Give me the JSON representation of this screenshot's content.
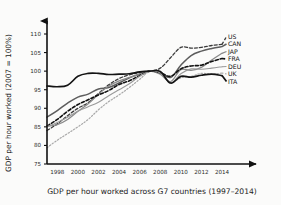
{
  "chart_data": {
    "type": "line",
    "title": "",
    "caption": "GDP per hour worked across G7 countries (1997–2014)",
    "xlabel": "",
    "ylabel": "GDP per hour worked (2007 = 100%)",
    "xlim": [
      1997,
      2014
    ],
    "ylim": [
      75,
      110
    ],
    "grid": false,
    "legend_position": "right-outside",
    "ytick_labels": [
      "110",
      "105",
      "100",
      "95",
      "90",
      "85",
      "80",
      "75"
    ],
    "yticks": [
      110,
      105,
      100,
      95,
      90,
      85,
      80,
      75
    ],
    "xtick_labels": [
      "1998",
      "2000",
      "2002",
      "2004",
      "2006",
      "2008",
      "2010",
      "2012",
      "2014"
    ],
    "xticks": [
      1998,
      2000,
      2002,
      2004,
      2006,
      2008,
      2010,
      2012,
      2014
    ],
    "x": [
      1997,
      1998,
      1999,
      2000,
      2001,
      2002,
      2003,
      2004,
      2005,
      2006,
      2007,
      2008,
      2009,
      2010,
      2011,
      2012,
      2013,
      2014
    ],
    "series": [
      {
        "name": "US",
        "label": "US",
        "style": "dashed",
        "color": "#3a3a3a",
        "width": 1.3,
        "dash": "3,2",
        "values": [
          84.0,
          85.8,
          88.0,
          90.0,
          91.5,
          94.0,
          96.3,
          98.0,
          99.0,
          99.6,
          100.0,
          100.8,
          103.6,
          106.4,
          106.2,
          106.4,
          106.9,
          107.2
        ]
      },
      {
        "name": "CAN",
        "label": "CAN",
        "style": "solid",
        "color": "#5d5d5d",
        "width": 1.5,
        "dash": "",
        "values": [
          87.6,
          89.4,
          91.4,
          93.0,
          93.8,
          95.2,
          95.6,
          96.8,
          98.2,
          99.2,
          100.0,
          99.6,
          98.3,
          101.6,
          104.2,
          105.4,
          106.1,
          106.6
        ]
      },
      {
        "name": "JAP",
        "label": "JAP",
        "style": "solid",
        "color": "#8a8a8a",
        "width": 1.3,
        "dash": "",
        "values": [
          85.2,
          85.6,
          87.0,
          89.2,
          91.2,
          93.8,
          96.0,
          97.4,
          98.3,
          99.2,
          100.0,
          99.2,
          97.2,
          100.4,
          100.2,
          101.0,
          103.0,
          104.8
        ]
      },
      {
        "name": "FRA",
        "label": "FRA",
        "style": "dashed-heavy",
        "color": "#111111",
        "width": 1.6,
        "dash": "3.2,2",
        "values": [
          85.2,
          87.0,
          89.2,
          91.0,
          92.3,
          93.6,
          94.8,
          96.4,
          97.4,
          98.8,
          100.0,
          99.6,
          98.6,
          100.6,
          101.4,
          101.6,
          102.6,
          103.4
        ]
      },
      {
        "name": "DEU",
        "label": "DEU",
        "style": "solid",
        "color": "#9a9a9a",
        "width": 1.1,
        "dash": "",
        "values": [
          85.0,
          86.2,
          87.6,
          89.2,
          90.4,
          91.6,
          93.4,
          95.0,
          96.6,
          98.6,
          100.0,
          99.6,
          96.8,
          99.3,
          100.6,
          100.5,
          100.8,
          101.2
        ]
      },
      {
        "name": "UK",
        "label": "UK",
        "style": "dotted",
        "color": "#a8a8a8",
        "width": 1.2,
        "dash": "1.4,1.8",
        "values": [
          79.4,
          81.4,
          83.2,
          85.0,
          87.0,
          89.6,
          91.8,
          93.6,
          95.6,
          97.8,
          100.0,
          99.6,
          97.0,
          98.2,
          98.6,
          99.4,
          99.2,
          99.5
        ]
      },
      {
        "name": "ITA",
        "label": "ITA",
        "style": "solid-heavy",
        "color": "#141414",
        "width": 1.7,
        "dash": "",
        "values": [
          96.0,
          95.8,
          96.2,
          98.6,
          99.4,
          99.4,
          99.1,
          99.2,
          99.3,
          99.8,
          100.0,
          99.9,
          96.8,
          98.6,
          98.4,
          98.9,
          99.2,
          98.8
        ]
      }
    ],
    "legend_entries": [
      {
        "label": "US",
        "y_value": 107.2
      },
      {
        "label": "CAN",
        "y_value": 106.6
      },
      {
        "label": "JAP",
        "y_value": 104.8
      },
      {
        "label": "FRA",
        "y_value": 103.4
      },
      {
        "label": "DEU",
        "y_value": 101.2
      },
      {
        "label": "UK",
        "y_value": 99.5
      },
      {
        "label": "ITA",
        "y_value": 98.8
      }
    ]
  },
  "figure": {
    "y_axis_title": "GDP per hour worked (2007 = 100%)",
    "caption": "GDP per hour worked across G7 countries (1997–2014)"
  }
}
